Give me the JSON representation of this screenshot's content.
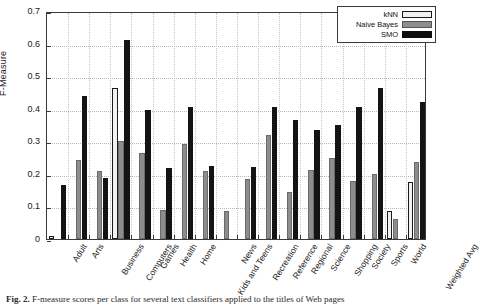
{
  "figure": {
    "caption_prefix": "Fig. 2.",
    "caption_text": "F-measure scores per class for several text classifiers applied to the titles of Web pages"
  },
  "legend": {
    "position": "top-right",
    "entries": [
      {
        "label": "kNN",
        "swatch": "white-outlined",
        "color": "#f2f2f2"
      },
      {
        "label": "Naive Bayes",
        "swatch": "gray-filled",
        "color": "#8d8d8d"
      },
      {
        "label": "SMO",
        "swatch": "black-filled",
        "color": "#141414"
      }
    ]
  },
  "chart_data": {
    "type": "bar",
    "title": "",
    "xlabel": "",
    "ylabel": "F-Measure",
    "ylim": [
      0,
      0.7
    ],
    "yticks": [
      0,
      0.1,
      0.2,
      0.3,
      0.4,
      0.5,
      0.6,
      0.7
    ],
    "ytick_labels": [
      "0",
      "0.1",
      "0.2",
      "0.3",
      "0.4",
      "0.5",
      "0.6",
      "0.7"
    ],
    "grid": true,
    "legend_position": "upper right",
    "categories": [
      "Adult",
      "Arts",
      "Business",
      "Computers",
      "Games",
      "Health",
      "Home",
      "Kids and Teens",
      "News",
      "Recreation",
      "Reference",
      "Regional",
      "Science",
      "Shopping",
      "Society",
      "Sports",
      "World",
      "Weighted Avg"
    ],
    "series": [
      {
        "name": "kNN",
        "color": "#f2f2f2",
        "values": [
          0.01,
          0.0,
          0.0,
          0.465,
          0.0,
          0.0,
          0.0,
          0.0,
          0.0,
          0.0,
          0.0,
          0.0,
          0.0,
          0.0,
          0.0,
          0.0,
          0.085,
          0.175
        ]
      },
      {
        "name": "Naive Bayes",
        "color": "#8d8d8d",
        "values": [
          0.0,
          0.243,
          0.208,
          0.302,
          0.263,
          0.088,
          0.293,
          0.21,
          0.086,
          0.185,
          0.318,
          0.143,
          0.212,
          0.248,
          0.177,
          0.2,
          0.06,
          0.235
        ]
      },
      {
        "name": "SMO",
        "color": "#141414",
        "values": [
          0.165,
          0.438,
          0.187,
          0.612,
          0.397,
          0.218,
          0.406,
          0.223,
          0.0,
          0.22,
          0.405,
          0.365,
          0.335,
          0.35,
          0.405,
          0.465,
          0.0,
          0.42
        ]
      }
    ]
  }
}
